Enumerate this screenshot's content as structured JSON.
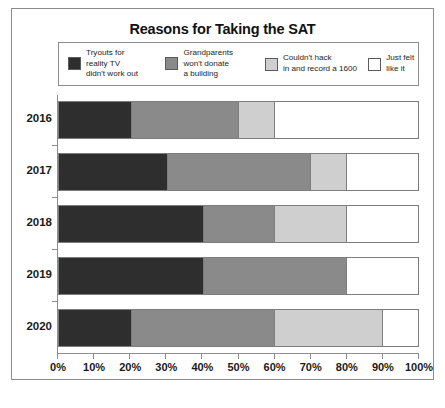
{
  "chart_data": {
    "type": "bar",
    "orientation": "horizontal",
    "stacked": true,
    "normalized_percent": true,
    "title": "Reasons for Taking the SAT",
    "xlabel": "",
    "ylabel": "",
    "xlim": [
      0,
      100
    ],
    "grid": false,
    "legend_position": "top",
    "categories": [
      "2016",
      "2017",
      "2018",
      "2019",
      "2020"
    ],
    "x_tick_labels": [
      "0%",
      "10%",
      "20%",
      "30%",
      "40%",
      "50%",
      "60%",
      "70%",
      "80%",
      "90%",
      "100%"
    ],
    "x_tick_values": [
      0,
      10,
      20,
      30,
      40,
      50,
      60,
      70,
      80,
      90,
      100
    ],
    "series": [
      {
        "name": "Tryouts for reality TV didn't work out",
        "color": "#2e2e2e",
        "values": [
          20,
          30,
          40,
          40,
          20
        ]
      },
      {
        "name": "Grandparents won't donate a building",
        "color": "#8a8a8a",
        "values": [
          30,
          40,
          20,
          40,
          40
        ]
      },
      {
        "name": "Couldn't hack in and record a 1600",
        "color": "#cfcfcf",
        "values": [
          10,
          10,
          20,
          0,
          30
        ]
      },
      {
        "name": "Just felt like it",
        "color": "#ffffff",
        "values": [
          40,
          20,
          20,
          20,
          10
        ]
      }
    ]
  },
  "legend": {
    "items": [
      {
        "label": "Tryouts for\nreality TV\ndidn't work out",
        "color": "#2e2e2e"
      },
      {
        "label": "Grandparents\nwon't donate\na building",
        "color": "#8a8a8a"
      },
      {
        "label": "Couldn't hack\nin and record a 1600",
        "color": "#cfcfcf"
      },
      {
        "label": "Just felt\nlike it",
        "color": "#ffffff"
      }
    ]
  }
}
